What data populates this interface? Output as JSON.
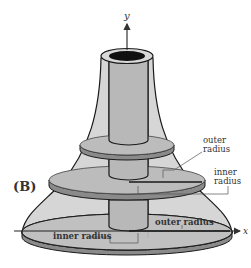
{
  "figure": {
    "panel_label": "(B)",
    "axes": {
      "y_label": "y",
      "x_label": "x"
    },
    "annotations": {
      "disk2_outer_line1": "outer",
      "disk2_outer_line2": "radius",
      "disk2_inner_line1": "inner",
      "disk2_inner_line2": "radius",
      "base_outer": "outer radius",
      "base_inner": "inner radius"
    },
    "colors": {
      "solid_fill": "#c9c9c9",
      "disk_top": "#b5b5b5",
      "disk_edge": "#8a8a8a",
      "hole": "#111111",
      "outline": "#1a1a1a"
    }
  }
}
